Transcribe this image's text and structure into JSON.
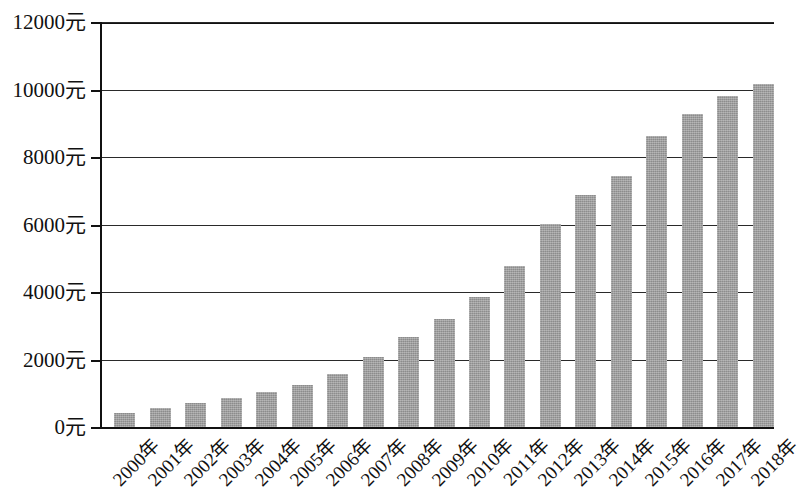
{
  "chart_data": {
    "type": "bar",
    "title": "",
    "subtitle": "",
    "xlabel": "",
    "ylabel": "",
    "categories": [
      "2000年",
      "2001年",
      "2002年",
      "2003年",
      "2004年",
      "2005年",
      "2006年",
      "2007年",
      "2008年",
      "2009年",
      "2010年",
      "2011年",
      "2012年",
      "2013年",
      "2014年",
      "2015年",
      "2016年",
      "2017年",
      "2018年"
    ],
    "values": [
      420,
      560,
      700,
      860,
      1050,
      1250,
      1560,
      2080,
      2660,
      3200,
      3840,
      4780,
      6010,
      6870,
      7440,
      8620,
      9280,
      9800,
      10150
    ],
    "ytick_labels": [
      "0元",
      "2000元",
      "4000元",
      "6000元",
      "8000元",
      "10000元",
      "12000元"
    ],
    "ytick_values": [
      0,
      2000,
      4000,
      6000,
      8000,
      10000,
      12000
    ],
    "ylim": [
      0,
      12000
    ],
    "grid": true,
    "legend": "none",
    "series": [
      {
        "name": "",
        "values": [
          420,
          560,
          700,
          860,
          1050,
          1250,
          1560,
          2080,
          2660,
          3200,
          3840,
          4780,
          6010,
          6870,
          7440,
          8620,
          9280,
          9800,
          10150
        ]
      }
    ],
    "colors": {
      "bar_fill": "#9a9a9a",
      "axis": "#111111",
      "gridline": "#2a2a2a",
      "background": "#ffffff"
    }
  }
}
